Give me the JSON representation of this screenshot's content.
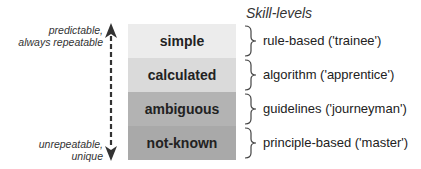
{
  "axis": {
    "top_label_line1": "predictable,",
    "top_label_line2": "always repeatable",
    "bottom_label_line1": "unrepeatable,",
    "bottom_label_line2": "unique"
  },
  "levels": [
    {
      "label": "simple",
      "color": "#ececec"
    },
    {
      "label": "calculated",
      "color": "#dadada"
    },
    {
      "label": "ambiguous",
      "color": "#b3b3b3"
    },
    {
      "label": "not-known",
      "color": "#a9a9a9"
    }
  ],
  "skills": {
    "title": "Skill-levels",
    "items": [
      {
        "label": "rule-based ('trainee')"
      },
      {
        "label": "algorithm ('apprentice')"
      },
      {
        "label": "guidelines ('journeyman')"
      },
      {
        "label": "principle-based ('master')"
      }
    ]
  }
}
